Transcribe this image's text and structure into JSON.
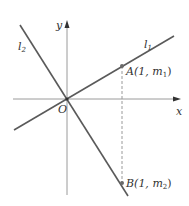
{
  "diagram": {
    "axes": {
      "x_label": "x",
      "y_label": "y",
      "origin_label": "O"
    },
    "lines": [
      {
        "name": "l1",
        "label_main": "l",
        "label_sub": "1",
        "description": "line through origin with positive slope"
      },
      {
        "name": "l2",
        "label_main": "l",
        "label_sub": "2",
        "description": "line through origin with negative slope"
      }
    ],
    "points": [
      {
        "name": "A",
        "label_prefix": "A(1, ",
        "label_var": "m",
        "label_sub": "1",
        "label_suffix": ")",
        "on_line": "l1"
      },
      {
        "name": "B",
        "label_prefix": "B(1, ",
        "label_var": "m",
        "label_sub": "2",
        "label_suffix": ")",
        "on_line": "l2"
      }
    ],
    "dashed_segment": {
      "from": "A",
      "to": "B",
      "description": "vertical dashed line at x = 1"
    },
    "colors": {
      "line": "#5a5a5a",
      "axis": "#9a9a9a",
      "dash": "#9a9a9a",
      "point": "#6a6a6a",
      "text": "#333333"
    }
  }
}
